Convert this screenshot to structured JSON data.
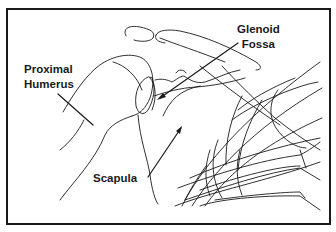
{
  "figure": {
    "labels": {
      "proximal_humerus": [
        "Proximal",
        "Humerus"
      ],
      "glenoid_fossa": [
        "Glenoid",
        "Fossa"
      ],
      "scapula": "Scapula"
    },
    "colors": {
      "line": "#1a1a1a",
      "background": "#ffffff"
    }
  }
}
